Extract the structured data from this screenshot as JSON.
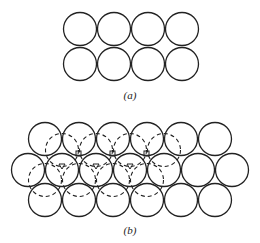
{
  "figure": {
    "label_a": "(a)",
    "label_b": "(b)",
    "stroke_color": "#222222"
  },
  "part_a": {
    "description": "Square packing of circles, 2 rows x 4 columns",
    "rows": 2,
    "cols": 4
  },
  "part_b": {
    "description": "Hexagonal close packing with a dashed second layer and marked interstitial sites",
    "rows": [
      6,
      7,
      6
    ]
  }
}
